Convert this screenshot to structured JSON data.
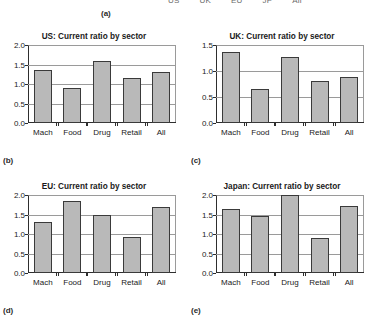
{
  "figure": {
    "top_legend_labels": [
      "US",
      "UK",
      "EU",
      "JP",
      "All"
    ],
    "panel_letters": {
      "a": "(a)",
      "b": "(b)",
      "c": "(c)",
      "d": "(d)",
      "e": "(e)"
    }
  },
  "chart_data": [
    {
      "type": "bar",
      "panel": "(b)",
      "title": "US: Current ratio by sector",
      "categories": [
        "Mach",
        "Food",
        "Drug",
        "Retail",
        "All"
      ],
      "values": [
        1.35,
        0.89,
        1.58,
        1.15,
        1.31
      ],
      "xlabel": "",
      "ylabel": "",
      "ylim": [
        0.0,
        2.0
      ],
      "yticks": [
        0.0,
        0.5,
        1.0,
        1.5,
        2.0
      ],
      "ytick_labels": [
        "0.0",
        "0.5",
        "1.0",
        "1.5",
        "2.0"
      ],
      "grid": true,
      "legend": false,
      "bar_color": "#b9b9b9",
      "bar_edge_color": "#3a3a3a"
    },
    {
      "type": "bar",
      "panel": "(c)",
      "title": "UK: Current ratio by sector",
      "categories": [
        "Mach",
        "Food",
        "Drug",
        "Retail",
        "All"
      ],
      "values": [
        1.37,
        0.66,
        1.27,
        0.8,
        0.89
      ],
      "xlabel": "",
      "ylabel": "",
      "ylim": [
        0.0,
        1.5
      ],
      "yticks": [
        0.0,
        0.5,
        1.0,
        1.5
      ],
      "ytick_labels": [
        "0.0",
        "0.5",
        "1.0",
        "1.5"
      ],
      "grid": true,
      "legend": false,
      "bar_color": "#b9b9b9",
      "bar_edge_color": "#3a3a3a"
    },
    {
      "type": "bar",
      "panel": "(d)",
      "title": "EU: Current ratio by sector",
      "categories": [
        "Mach",
        "Food",
        "Drug",
        "Retail",
        "All"
      ],
      "values": [
        1.31,
        1.85,
        1.49,
        0.92,
        1.7
      ],
      "xlabel": "",
      "ylabel": "",
      "ylim": [
        0.0,
        2.0
      ],
      "yticks": [
        0.0,
        0.5,
        1.0,
        1.5,
        2.0
      ],
      "ytick_labels": [
        "0.0",
        "0.5",
        "1.0",
        "1.5",
        "2.0"
      ],
      "grid": true,
      "legend": false,
      "bar_color": "#b9b9b9",
      "bar_edge_color": "#3a3a3a"
    },
    {
      "type": "bar",
      "panel": "(e)",
      "title": "Japan: Current ratio by sector",
      "categories": [
        "Mach",
        "Food",
        "Drug",
        "Retail",
        "All"
      ],
      "values": [
        1.64,
        1.47,
        2.0,
        0.91,
        1.73
      ],
      "xlabel": "",
      "ylabel": "",
      "ylim": [
        0.0,
        2.0
      ],
      "yticks": [
        0.0,
        0.5,
        1.0,
        1.5,
        2.0
      ],
      "ytick_labels": [
        "0.0",
        "0.5",
        "1.0",
        "1.5",
        "2.0"
      ],
      "grid": true,
      "legend": false,
      "bar_color": "#b9b9b9",
      "bar_edge_color": "#3a3a3a"
    }
  ]
}
